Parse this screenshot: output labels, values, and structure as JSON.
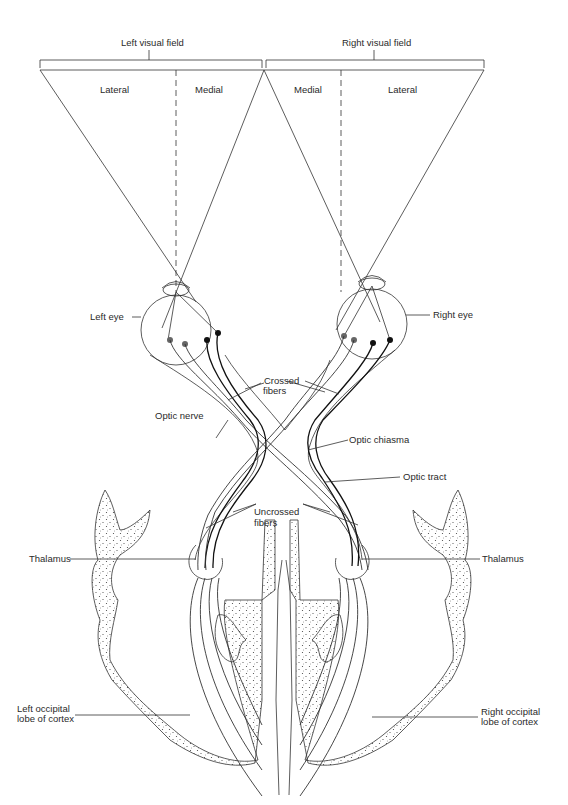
{
  "labels": {
    "left_visual_field": "Left visual field",
    "right_visual_field": "Right visual field",
    "left_lateral": "Lateral",
    "left_medial": "Medial",
    "right_medial": "Medial",
    "right_lateral": "Lateral",
    "left_eye": "Left eye",
    "right_eye": "Right eye",
    "crossed_fibers_1": "Crossed",
    "crossed_fibers_2": "fibers",
    "optic_nerve": "Optic nerve",
    "optic_chiasma": "Optic chiasma",
    "optic_tract": "Optic tract",
    "uncrossed_fibers_1": "Uncrossed",
    "uncrossed_fibers_2": "fibers",
    "thalamus_left": "Thalamus",
    "thalamus_right": "Thalamus",
    "left_occipital_1": "Left occipital",
    "left_occipital_2": "lobe of cortex",
    "right_occipital_1": "Right occipital",
    "right_occipital_2": "lobe of cortex"
  },
  "colors": {
    "line": "#333333",
    "dark_fiber": "#111111",
    "retina_dot_gray": "#666666",
    "retina_dot_dark": "#111111",
    "background": "#ffffff"
  }
}
